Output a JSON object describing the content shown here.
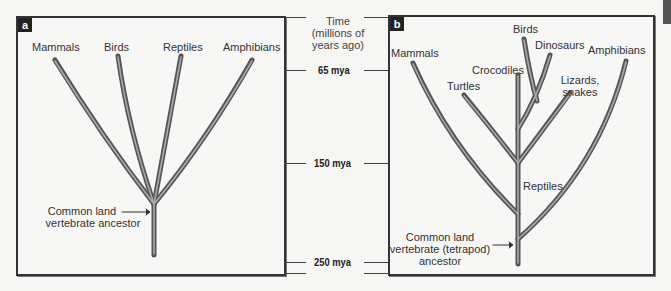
{
  "panel_a": {
    "letter": "a",
    "labels": {
      "mammals": "Mammals",
      "birds": "Birds",
      "reptiles": "Reptiles",
      "amphibians": "Amphibians"
    },
    "ancestor_line1": "Common land",
    "ancestor_line2": "vertebrate ancestor"
  },
  "time_axis": {
    "header_line1": "Time",
    "header_line2": "(millions of",
    "header_line3": "years ago)",
    "ticks": [
      "65 mya",
      "150 mya",
      "250 mya"
    ]
  },
  "panel_b": {
    "letter": "b",
    "labels": {
      "mammals": "Mammals",
      "birds": "Birds",
      "dinosaurs": "Dinosaurs",
      "amphibians": "Amphibians",
      "crocodiles": "Crocodiles",
      "turtles": "Turtles",
      "lizards_line1": "Lizards,",
      "lizards_line2": "snakes",
      "reptiles": "Reptiles"
    },
    "ancestor_line1": "Common land",
    "ancestor_line2": "vertebrate (tetrapod)",
    "ancestor_line3": "ancestor"
  },
  "colors": {
    "branch_outer": "#555555",
    "branch_inner": "#a8a8a8",
    "panel_bg": "#f7f7f6",
    "border": "#333333"
  }
}
